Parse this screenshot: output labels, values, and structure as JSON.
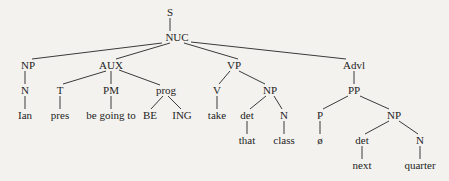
{
  "tree": {
    "nodes": [
      {
        "id": "S",
        "label": "S",
        "x": 170,
        "y": 12
      },
      {
        "id": "NUC",
        "label": "NUC",
        "x": 177,
        "y": 37
      },
      {
        "id": "NP1",
        "label": "NP",
        "x": 28,
        "y": 65
      },
      {
        "id": "N1",
        "label": "N",
        "x": 25,
        "y": 90
      },
      {
        "id": "Ian",
        "label": "Ian",
        "x": 25,
        "y": 115
      },
      {
        "id": "AUX",
        "label": "AUX",
        "x": 111,
        "y": 65
      },
      {
        "id": "T",
        "label": "T",
        "x": 60,
        "y": 90
      },
      {
        "id": "pres",
        "label": "pres",
        "x": 60,
        "y": 115
      },
      {
        "id": "PM",
        "label": "PM",
        "x": 111,
        "y": 90
      },
      {
        "id": "begoing",
        "label": "be going to",
        "x": 111,
        "y": 115
      },
      {
        "id": "prog",
        "label": "prog",
        "x": 166,
        "y": 90
      },
      {
        "id": "BE",
        "label": "BE",
        "x": 150,
        "y": 115
      },
      {
        "id": "ING",
        "label": "ING",
        "x": 182,
        "y": 115
      },
      {
        "id": "VP",
        "label": "VP",
        "x": 234,
        "y": 65
      },
      {
        "id": "V",
        "label": "V",
        "x": 217,
        "y": 90
      },
      {
        "id": "take",
        "label": "take",
        "x": 217,
        "y": 115
      },
      {
        "id": "NP2",
        "label": "NP",
        "x": 270,
        "y": 90
      },
      {
        "id": "det1",
        "label": "det",
        "x": 247,
        "y": 115
      },
      {
        "id": "that",
        "label": "that",
        "x": 247,
        "y": 140
      },
      {
        "id": "N2",
        "label": "N",
        "x": 284,
        "y": 115
      },
      {
        "id": "class",
        "label": "class",
        "x": 284,
        "y": 140
      },
      {
        "id": "Advl",
        "label": "Advl",
        "x": 354,
        "y": 65
      },
      {
        "id": "PP",
        "label": "PP",
        "x": 354,
        "y": 90
      },
      {
        "id": "P",
        "label": "P",
        "x": 320,
        "y": 115
      },
      {
        "id": "null",
        "label": "ø",
        "x": 320,
        "y": 140
      },
      {
        "id": "NP3",
        "label": "NP",
        "x": 394,
        "y": 115
      },
      {
        "id": "det2",
        "label": "det",
        "x": 362,
        "y": 140
      },
      {
        "id": "next",
        "label": "next",
        "x": 362,
        "y": 165
      },
      {
        "id": "N3",
        "label": "N",
        "x": 420,
        "y": 140
      },
      {
        "id": "quarter",
        "label": "quarter",
        "x": 420,
        "y": 165
      }
    ],
    "edges": [
      {
        "x1": 170,
        "y1": 18,
        "x2": 170,
        "y2": 31
      },
      {
        "x1": 162,
        "y1": 43,
        "x2": 32,
        "y2": 59
      },
      {
        "x1": 170,
        "y1": 43,
        "x2": 116,
        "y2": 59
      },
      {
        "x1": 184,
        "y1": 43,
        "x2": 238,
        "y2": 59
      },
      {
        "x1": 191,
        "y1": 42,
        "x2": 346,
        "y2": 59
      },
      {
        "x1": 25,
        "y1": 71,
        "x2": 25,
        "y2": 84
      },
      {
        "x1": 25,
        "y1": 96,
        "x2": 25,
        "y2": 109
      },
      {
        "x1": 106,
        "y1": 71,
        "x2": 63,
        "y2": 84
      },
      {
        "x1": 111,
        "y1": 71,
        "x2": 111,
        "y2": 84
      },
      {
        "x1": 119,
        "y1": 70,
        "x2": 160,
        "y2": 85
      },
      {
        "x1": 60,
        "y1": 96,
        "x2": 60,
        "y2": 109
      },
      {
        "x1": 111,
        "y1": 96,
        "x2": 111,
        "y2": 109
      },
      {
        "x1": 163,
        "y1": 96,
        "x2": 151,
        "y2": 109
      },
      {
        "x1": 168,
        "y1": 96,
        "x2": 181,
        "y2": 109
      },
      {
        "x1": 230,
        "y1": 71,
        "x2": 219,
        "y2": 84
      },
      {
        "x1": 239,
        "y1": 71,
        "x2": 265,
        "y2": 84
      },
      {
        "x1": 217,
        "y1": 96,
        "x2": 217,
        "y2": 109
      },
      {
        "x1": 266,
        "y1": 96,
        "x2": 250,
        "y2": 109
      },
      {
        "x1": 274,
        "y1": 96,
        "x2": 282,
        "y2": 109
      },
      {
        "x1": 247,
        "y1": 121,
        "x2": 247,
        "y2": 134
      },
      {
        "x1": 284,
        "y1": 121,
        "x2": 284,
        "y2": 134
      },
      {
        "x1": 354,
        "y1": 71,
        "x2": 354,
        "y2": 84
      },
      {
        "x1": 348,
        "y1": 96,
        "x2": 323,
        "y2": 109
      },
      {
        "x1": 360,
        "y1": 96,
        "x2": 389,
        "y2": 109
      },
      {
        "x1": 320,
        "y1": 121,
        "x2": 320,
        "y2": 134
      },
      {
        "x1": 389,
        "y1": 121,
        "x2": 365,
        "y2": 134
      },
      {
        "x1": 399,
        "y1": 121,
        "x2": 418,
        "y2": 134
      },
      {
        "x1": 362,
        "y1": 146,
        "x2": 362,
        "y2": 159
      },
      {
        "x1": 420,
        "y1": 146,
        "x2": 420,
        "y2": 159
      }
    ]
  }
}
